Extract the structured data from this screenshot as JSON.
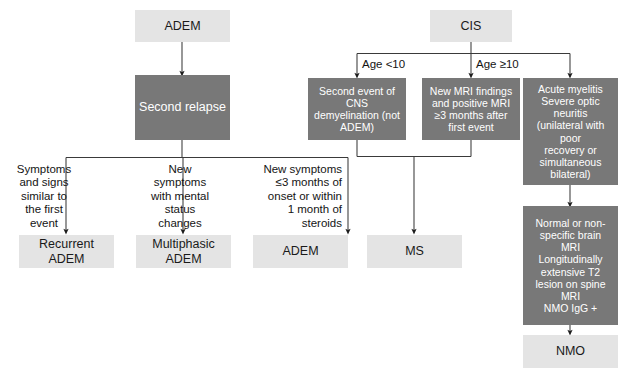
{
  "figure": {
    "kind": "clinical-diagnostic-flowchart",
    "palette": {
      "light_box_fill": "#e4e4e4",
      "light_box_text": "#1a1a1a",
      "dark_box_fill": "#787878",
      "dark_box_text": "#ffffff",
      "connector": "#222222",
      "background": "#ffffff"
    }
  },
  "nodes": {
    "adem_root": "ADEM",
    "second_relapse": "Second relapse",
    "recurrent_adem": "Recurrent\nADEM",
    "multiphasic_adem": "Multiphasic\nADEM",
    "adem_outcome": "ADEM",
    "cis_root": "CIS",
    "second_event_cns": "Second event of\nCNS\ndemyelination (not\nADEM)",
    "new_mri_findings": "New MRI findings\nand positive MRI\n≥3 months after\nfirst event",
    "acute_myelitis": "Acute myelitis\nSevere optic\nneuritis\n(unilateral with\npoor\nrecovery or\nsimultaneous\nbilateral)",
    "normal_brain_mri": "Normal or non-\nspecific brain\nMRI\nLongitudinally\nextensive T2\nlesion on spine\nMRI\nNMO IgG +",
    "ms_outcome": "MS",
    "nmo_outcome": "NMO"
  },
  "edge_labels": {
    "symptoms_similar": "Symptoms\nand signs\nsimilar to\nthe first\nevent",
    "new_symptoms_mental": "New\nsymptoms\nwith mental\nstatus\nchanges",
    "new_symptoms_3months": "New symptoms\n≤3 months of\nonset or within\n1 month of\nsteroids",
    "age_under_10": "Age <10",
    "age_10_or_over": "Age ≥10"
  }
}
